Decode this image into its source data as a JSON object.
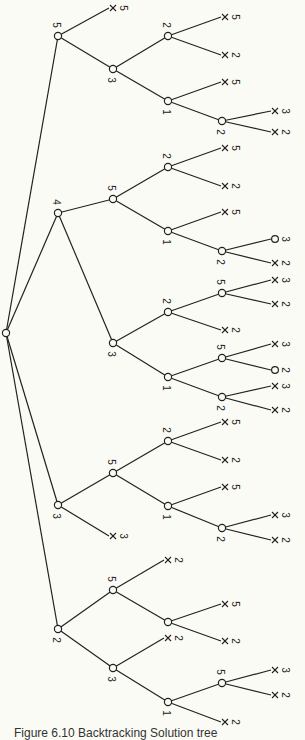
{
  "caption": "Figure 6.10 Backtracking Solution tree",
  "colors": {
    "background": "#fbfbf6",
    "ink": "#222222"
  },
  "root": {
    "id": "r",
    "x": 6,
    "y": 333,
    "label": ""
  },
  "nodes": [
    {
      "id": "a",
      "x": 58,
      "y": 36,
      "label": "5",
      "lpos": "above"
    },
    {
      "id": "a1",
      "x": 113,
      "y": 69,
      "label": "3",
      "lpos": "below"
    },
    {
      "id": "a1a",
      "x": 168,
      "y": 36,
      "label": "2",
      "lpos": "above"
    },
    {
      "id": "a1b",
      "x": 168,
      "y": 101,
      "label": "1",
      "lpos": "below"
    },
    {
      "id": "a1b2",
      "x": 222,
      "y": 121,
      "label": "2",
      "lpos": "below"
    },
    {
      "id": "b",
      "x": 58,
      "y": 213,
      "label": "4",
      "lpos": "above"
    },
    {
      "id": "b1",
      "x": 113,
      "y": 199,
      "label": "5",
      "lpos": "above"
    },
    {
      "id": "b1a",
      "x": 168,
      "y": 167,
      "label": "2",
      "lpos": "above"
    },
    {
      "id": "b1b",
      "x": 168,
      "y": 231,
      "label": "1",
      "lpos": "below"
    },
    {
      "id": "b1b2",
      "x": 222,
      "y": 251,
      "label": "2",
      "lpos": "below"
    },
    {
      "id": "b2",
      "x": 113,
      "y": 343,
      "label": "3",
      "lpos": "below"
    },
    {
      "id": "b2a",
      "x": 168,
      "y": 312,
      "label": "2",
      "lpos": "above"
    },
    {
      "id": "b2a5",
      "x": 222,
      "y": 293,
      "label": "5",
      "lpos": "above"
    },
    {
      "id": "b2b",
      "x": 168,
      "y": 377,
      "label": "1",
      "lpos": "below"
    },
    {
      "id": "b2b5",
      "x": 222,
      "y": 358,
      "label": "5",
      "lpos": "above"
    },
    {
      "id": "b2b2",
      "x": 222,
      "y": 397,
      "label": "2",
      "lpos": "below"
    },
    {
      "id": "c",
      "x": 58,
      "y": 505,
      "label": "3",
      "lpos": "below"
    },
    {
      "id": "c1",
      "x": 113,
      "y": 473,
      "label": "5",
      "lpos": "above"
    },
    {
      "id": "c1a",
      "x": 168,
      "y": 441,
      "label": "2",
      "lpos": "above"
    },
    {
      "id": "c1b",
      "x": 168,
      "y": 506,
      "label": "1",
      "lpos": "below"
    },
    {
      "id": "c1b2",
      "x": 222,
      "y": 528,
      "label": "2",
      "lpos": "below"
    },
    {
      "id": "d",
      "x": 58,
      "y": 629,
      "label": "2",
      "lpos": "below"
    },
    {
      "id": "d1",
      "x": 113,
      "y": 590,
      "label": "5",
      "lpos": "above"
    },
    {
      "id": "d1b",
      "x": 168,
      "y": 622,
      "label": "",
      "lpos": "below"
    },
    {
      "id": "d2",
      "x": 113,
      "y": 668,
      "label": "3",
      "lpos": "below"
    },
    {
      "id": "d2b",
      "x": 168,
      "y": 702,
      "label": "1",
      "lpos": "below"
    },
    {
      "id": "d2b5",
      "x": 222,
      "y": 683,
      "label": "5",
      "lpos": "above"
    }
  ],
  "leaves": [
    {
      "parent": "a",
      "x": 113,
      "y": 8,
      "mark": "X",
      "value": "5"
    },
    {
      "parent": "a1a",
      "x": 225,
      "y": 17,
      "mark": "X",
      "value": "5"
    },
    {
      "parent": "a1a",
      "x": 225,
      "y": 55,
      "mark": "X",
      "value": "2"
    },
    {
      "parent": "a1b",
      "x": 225,
      "y": 82,
      "mark": "X",
      "value": "5"
    },
    {
      "parent": "a1b2",
      "x": 275,
      "y": 111,
      "mark": "X",
      "value": "3"
    },
    {
      "parent": "a1b2",
      "x": 275,
      "y": 132,
      "mark": "X",
      "value": "2"
    },
    {
      "parent": "b1a",
      "x": 225,
      "y": 148,
      "mark": "X",
      "value": "5"
    },
    {
      "parent": "b1a",
      "x": 225,
      "y": 186,
      "mark": "X",
      "value": "2"
    },
    {
      "parent": "b1b",
      "x": 225,
      "y": 212,
      "mark": "X",
      "value": "5"
    },
    {
      "parent": "b1b2",
      "x": 275,
      "y": 239,
      "mark": "O",
      "value": "3"
    },
    {
      "parent": "b1b2",
      "x": 275,
      "y": 263,
      "mark": "X",
      "value": "2"
    },
    {
      "parent": "b2a5",
      "x": 275,
      "y": 280,
      "mark": "X",
      "value": "3"
    },
    {
      "parent": "b2a5",
      "x": 275,
      "y": 304,
      "mark": "X",
      "value": "2"
    },
    {
      "parent": "b2a",
      "x": 225,
      "y": 330,
      "mark": "X",
      "value": "2"
    },
    {
      "parent": "b2b5",
      "x": 275,
      "y": 344,
      "mark": "X",
      "value": "3"
    },
    {
      "parent": "b2b5",
      "x": 275,
      "y": 370,
      "mark": "O",
      "value": "2"
    },
    {
      "parent": "b2b2",
      "x": 275,
      "y": 386,
      "mark": "X",
      "value": "3"
    },
    {
      "parent": "b2b2",
      "x": 275,
      "y": 410,
      "mark": "X",
      "value": "2"
    },
    {
      "parent": "c1a",
      "x": 225,
      "y": 422,
      "mark": "X",
      "value": "5"
    },
    {
      "parent": "c1a",
      "x": 225,
      "y": 460,
      "mark": "X",
      "value": "2"
    },
    {
      "parent": "c1b",
      "x": 225,
      "y": 487,
      "mark": "X",
      "value": "5"
    },
    {
      "parent": "c1b2",
      "x": 275,
      "y": 515,
      "mark": "X",
      "value": "3"
    },
    {
      "parent": "c1b2",
      "x": 275,
      "y": 540,
      "mark": "X",
      "value": "2"
    },
    {
      "parent": "c",
      "x": 113,
      "y": 536,
      "mark": "X",
      "value": "3"
    },
    {
      "parent": "d1",
      "x": 168,
      "y": 560,
      "mark": "X",
      "value": "2"
    },
    {
      "parent": "d1b",
      "x": 225,
      "y": 604,
      "mark": "X",
      "value": "5"
    },
    {
      "parent": "d1b",
      "x": 225,
      "y": 641,
      "mark": "X",
      "value": "2"
    },
    {
      "parent": "d2",
      "x": 168,
      "y": 638,
      "mark": "X",
      "value": "2"
    },
    {
      "parent": "d2b5",
      "x": 275,
      "y": 670,
      "mark": "X",
      "value": "3"
    },
    {
      "parent": "d2b5",
      "x": 275,
      "y": 695,
      "mark": "X",
      "value": "2"
    },
    {
      "parent": "d2b",
      "x": 225,
      "y": 722,
      "mark": "X",
      "value": "2"
    }
  ],
  "edges": [
    [
      "r",
      "a"
    ],
    [
      "r",
      "b"
    ],
    [
      "r",
      "c"
    ],
    [
      "r",
      "d"
    ],
    [
      "a",
      "a1"
    ],
    [
      "a1",
      "a1a"
    ],
    [
      "a1",
      "a1b"
    ],
    [
      "a1b",
      "a1b2"
    ],
    [
      "b",
      "b1"
    ],
    [
      "b1",
      "b1a"
    ],
    [
      "b1",
      "b1b"
    ],
    [
      "b1b",
      "b1b2"
    ],
    [
      "b",
      "b2"
    ],
    [
      "b2",
      "b2a"
    ],
    [
      "b2a",
      "b2a5"
    ],
    [
      "b2",
      "b2b"
    ],
    [
      "b2b",
      "b2b5"
    ],
    [
      "b2b",
      "b2b2"
    ],
    [
      "c",
      "c1"
    ],
    [
      "c1",
      "c1a"
    ],
    [
      "c1",
      "c1b"
    ],
    [
      "c1b",
      "c1b2"
    ],
    [
      "d",
      "d1"
    ],
    [
      "d1",
      "d1b"
    ],
    [
      "d",
      "d2"
    ],
    [
      "d2",
      "d2b"
    ],
    [
      "d2b",
      "d2b5"
    ]
  ]
}
